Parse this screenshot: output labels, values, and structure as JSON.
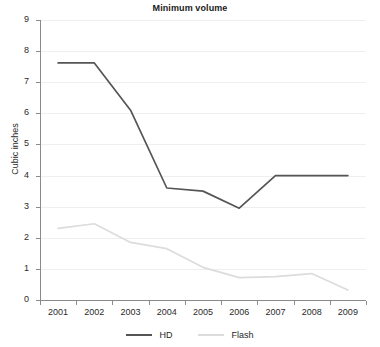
{
  "chart_data": {
    "type": "line",
    "title": "Minimum volume",
    "xlabel": "",
    "ylabel": "Cubic inches",
    "categories": [
      "2001",
      "2002",
      "2003",
      "2004",
      "2005",
      "2006",
      "2007",
      "2008",
      "2009"
    ],
    "ylim": [
      0,
      9
    ],
    "yticks": [
      "0",
      "1",
      "2",
      "3",
      "4",
      "5",
      "6",
      "7",
      "8",
      "9"
    ],
    "grid": true,
    "legend_position": "bottom",
    "series": [
      {
        "name": "HD",
        "color": "#555555",
        "values": [
          7.62,
          7.62,
          6.1,
          3.6,
          3.5,
          2.95,
          4.0,
          4.0,
          4.0
        ]
      },
      {
        "name": "Flash",
        "color": "#dcdcdc",
        "values": [
          2.3,
          2.45,
          1.85,
          1.65,
          1.05,
          0.72,
          0.75,
          0.85,
          0.32
        ]
      }
    ]
  },
  "legend": {
    "items": [
      {
        "label": "HD"
      },
      {
        "label": "Flash"
      }
    ]
  },
  "axes": {
    "y_axis_color": "#8a8a8a",
    "x_axis_color": "#8a8a8a",
    "gridline_color": "#efefef"
  }
}
